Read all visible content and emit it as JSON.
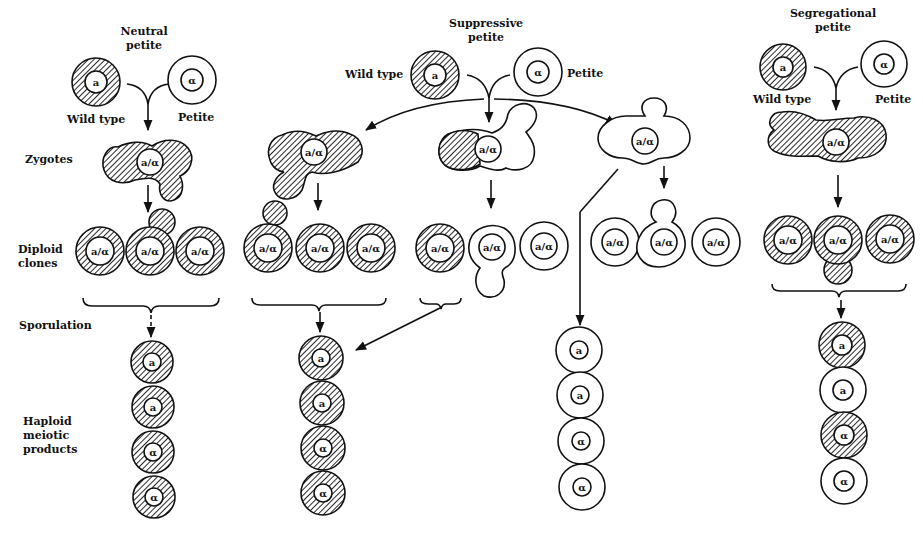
{
  "row_labels": {
    "zygotes": "Zygotes",
    "diploid_1": "Diploid",
    "diploid_2": "clones",
    "sporulation": "Sporulation",
    "haploid_1": "Haploid",
    "haploid_2": "meiotic",
    "haploid_3": "products"
  },
  "panels": {
    "neutral": {
      "title_1": "Neutral",
      "title_2": "petite",
      "wild_type": "Wild type",
      "petite": "Petite",
      "wt_allele": "a",
      "petite_allele": "α",
      "zygote": "a/α",
      "diploids": [
        "a/α",
        "a/α",
        "a/α"
      ],
      "haploids": [
        "a",
        "a",
        "α",
        "α"
      ]
    },
    "suppressive": {
      "title_1": "Suppressive",
      "title_2": "petite",
      "wild_type": "Wild type",
      "petite": "Petite",
      "wt_allele": "a",
      "petite_allele": "α",
      "zygotes": [
        "a/α",
        "a/α",
        "a/α"
      ],
      "diploids_left": [
        "a/α",
        "a/α",
        "a/α"
      ],
      "diploids_mid": [
        "a/α",
        "a/α",
        "a/α"
      ],
      "diploids_right": [
        "a/α",
        "a/α",
        "a/α"
      ],
      "haploids_left": [
        "a",
        "a",
        "α",
        "α"
      ],
      "haploids_right": [
        "a",
        "a",
        "α",
        "α"
      ]
    },
    "segregational": {
      "title_1": "Segregational",
      "title_2": "petite",
      "wild_type": "Wild type",
      "petite": "Petite",
      "wt_allele": "a",
      "petite_allele": "α",
      "zygote": "a/α",
      "diploids": [
        "a/α",
        "a/α",
        "a/α"
      ],
      "haploids": [
        "a",
        "a",
        "α",
        "α"
      ]
    }
  },
  "colors": {
    "ink": "#111111",
    "background": "#ffffff"
  }
}
